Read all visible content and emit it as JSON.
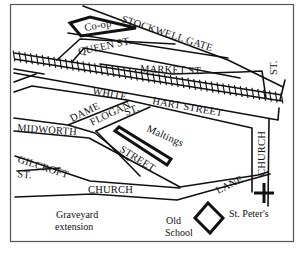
{
  "map": {
    "colors": {
      "ink": "#111111",
      "frame": "#555555",
      "background": "#ffffff"
    },
    "streets": {
      "stockwell_gate": "STOCKWELL GATE",
      "queen_st": "QUEEN  ST.",
      "market_st": "MARKET  ST.",
      "white": "WHITE",
      "hart_street": "HART  STREET",
      "dame": "DAME",
      "flogan": "FLOGAN",
      "flogan_st": "ST.",
      "midworth": "MIDWORTH",
      "street": "STREET",
      "gilcroft": "GILCROFT",
      "gilcroft_st": "ST.",
      "church": "CHURCH",
      "lane": "LANE",
      "church_vertical": "CHURCH",
      "st_vertical": "ST."
    },
    "buildings": {
      "coop": "Co-op",
      "maltings": "Maltings",
      "old_school_line1": "Old",
      "old_school_line2": "School"
    },
    "landmarks": {
      "st_peters": "St. Peter's",
      "graveyard_line1": "Graveyard",
      "graveyard_line2": "extension"
    },
    "icons": {
      "church_cross": "cross-icon",
      "railway": "railway-track"
    }
  }
}
